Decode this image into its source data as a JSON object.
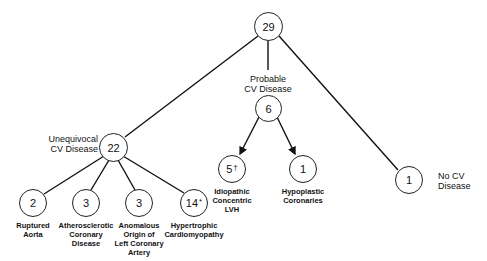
{
  "root": {
    "count": "29"
  },
  "probable": {
    "label": "Probable\nCV Disease",
    "count": "6",
    "children": [
      {
        "count": "5",
        "mark": "†",
        "label": "Idiopathic\nConcentric\nLVH"
      },
      {
        "count": "1",
        "mark": "",
        "label": "Hypoplastic\nCoronaries"
      }
    ]
  },
  "unequivocal": {
    "label": "Unequivocal\nCV Disease",
    "count": "22",
    "children": [
      {
        "count": "2",
        "mark": "",
        "label": "Ruptured\nAorta"
      },
      {
        "count": "3",
        "mark": "",
        "label": "Atherosclerotic\nCoronary\nDisease"
      },
      {
        "count": "3",
        "mark": "",
        "label": "Anomalous\nOrigin of\nLeft Coronary\nArtery"
      },
      {
        "count": "14",
        "mark": "*",
        "label": "Hypertrophic\nCardiomyopathy"
      }
    ]
  },
  "no_cv": {
    "label": "No CV\nDisease",
    "count": "1"
  }
}
